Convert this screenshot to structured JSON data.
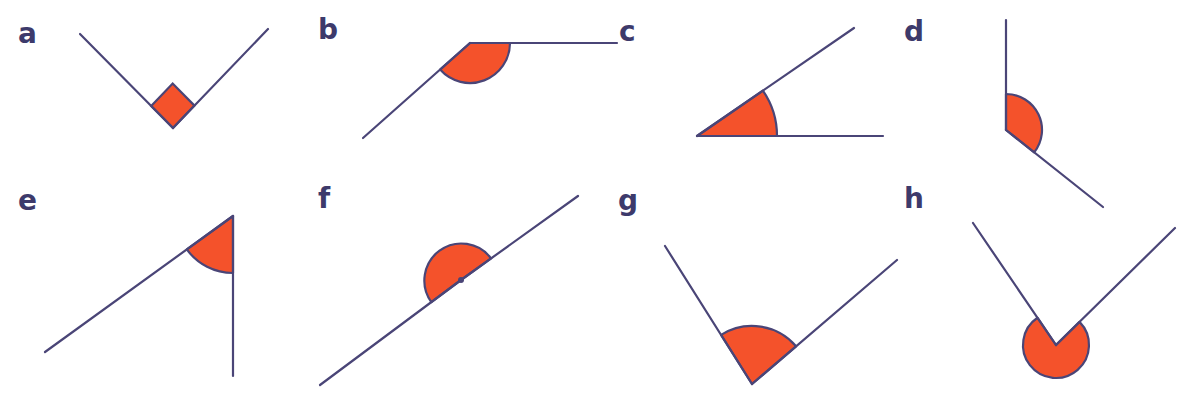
{
  "colors": {
    "line": "#4a4577",
    "fill": "#f4522b",
    "label": "#3d3a6b",
    "background": "#ffffff"
  },
  "diagrams": [
    {
      "label": "a",
      "label_pos": [
        18,
        38
      ],
      "type": "right-angle-square",
      "vertex": [
        173,
        128
      ],
      "rays": [
        [
          80,
          34
        ],
        [
          268,
          29
        ]
      ],
      "marker_size": 31
    },
    {
      "label": "b",
      "label_pos": [
        318,
        34
      ],
      "type": "obtuse",
      "vertex": [
        470,
        43
      ],
      "rays": [
        [
          363,
          138
        ],
        [
          617,
          43
        ]
      ],
      "arc_radius": 40,
      "arc_side": "below"
    },
    {
      "label": "c",
      "label_pos": [
        619,
        36
      ],
      "type": "acute",
      "vertex": [
        697,
        136
      ],
      "rays": [
        [
          883,
          136
        ],
        [
          854,
          28
        ]
      ],
      "arc_radius": 80
    },
    {
      "label": "d",
      "label_pos": [
        904,
        36
      ],
      "type": "obtuse",
      "vertex": [
        1006,
        130
      ],
      "rays": [
        [
          1006,
          20
        ],
        [
          1103,
          207
        ]
      ],
      "arc_radius": 36
    },
    {
      "label": "e",
      "label_pos": [
        18,
        205
      ],
      "type": "acute",
      "vertex": [
        233,
        216
      ],
      "rays": [
        [
          45,
          352
        ],
        [
          233,
          376
        ]
      ],
      "arc_radius": 57
    },
    {
      "label": "f",
      "label_pos": [
        318,
        203
      ],
      "type": "straight",
      "vertex": [
        461,
        280
      ],
      "rays": [
        [
          320,
          385
        ],
        [
          578,
          196
        ]
      ],
      "arc_radius": 37
    },
    {
      "label": "g",
      "label_pos": [
        618,
        205
      ],
      "type": "obtuse-right",
      "vertex": [
        752,
        384
      ],
      "rays": [
        [
          665,
          246
        ],
        [
          897,
          260
        ]
      ],
      "arc_radius": 58
    },
    {
      "label": "h",
      "label_pos": [
        904,
        203
      ],
      "type": "reflex",
      "vertex": [
        1056,
        345
      ],
      "rays": [
        [
          973,
          223
        ],
        [
          1175,
          228
        ]
      ],
      "arc_radius": 33
    }
  ]
}
